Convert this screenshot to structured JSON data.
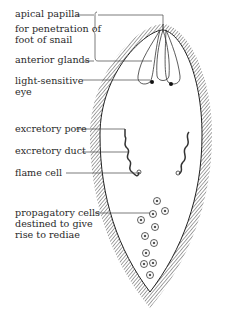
{
  "diagram": {
    "labels": {
      "apical_papilla": "apical papilla",
      "penetration_1": "for penetration of",
      "penetration_2": "foot of snail",
      "anterior_glands": "anterior glands",
      "eye_1": "light-sensitive",
      "eye_2": "eye",
      "excretory_pore": "excretory pore",
      "excretory_duct": "excretory duct",
      "flame_cell": "flame cell",
      "propagatory_1": "propagatory cells",
      "propagatory_2": "destined to give",
      "propagatory_3": "rise to rediae"
    },
    "colors": {
      "ink": "#2a2a2a",
      "background": "#ffffff"
    }
  }
}
